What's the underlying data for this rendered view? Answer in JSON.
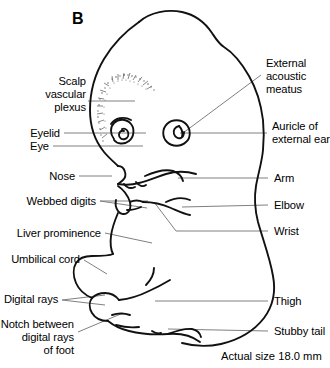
{
  "figure": {
    "panel_letter": "B",
    "scale_note": "Actual size 18.0 mm",
    "outline_color": "#000000",
    "leader_color": "#808080",
    "background_color": "#ffffff"
  },
  "labels": {
    "scalp_vascular_plexus": "Scalp\nvascular\nplexus",
    "eyelid": "Eyelid",
    "eye": "Eye",
    "nose": "Nose",
    "webbed_digits": "Webbed digits",
    "liver_prominence": "Liver prominence",
    "umbilical_cord": "Umbilical cord",
    "digital_rays": "Digital rays",
    "notch_between_digital_rays_of_foot": "Notch between\ndigital rays\nof foot",
    "external_acoustic_meatus": "External\nacoustic\nmeatus",
    "auricle_of_external_ear": "Auricle of\nexternal ear",
    "arm": "Arm",
    "elbow": "Elbow",
    "wrist": "Wrist",
    "thigh": "Thigh",
    "stubby_tail": "Stubby tail"
  }
}
